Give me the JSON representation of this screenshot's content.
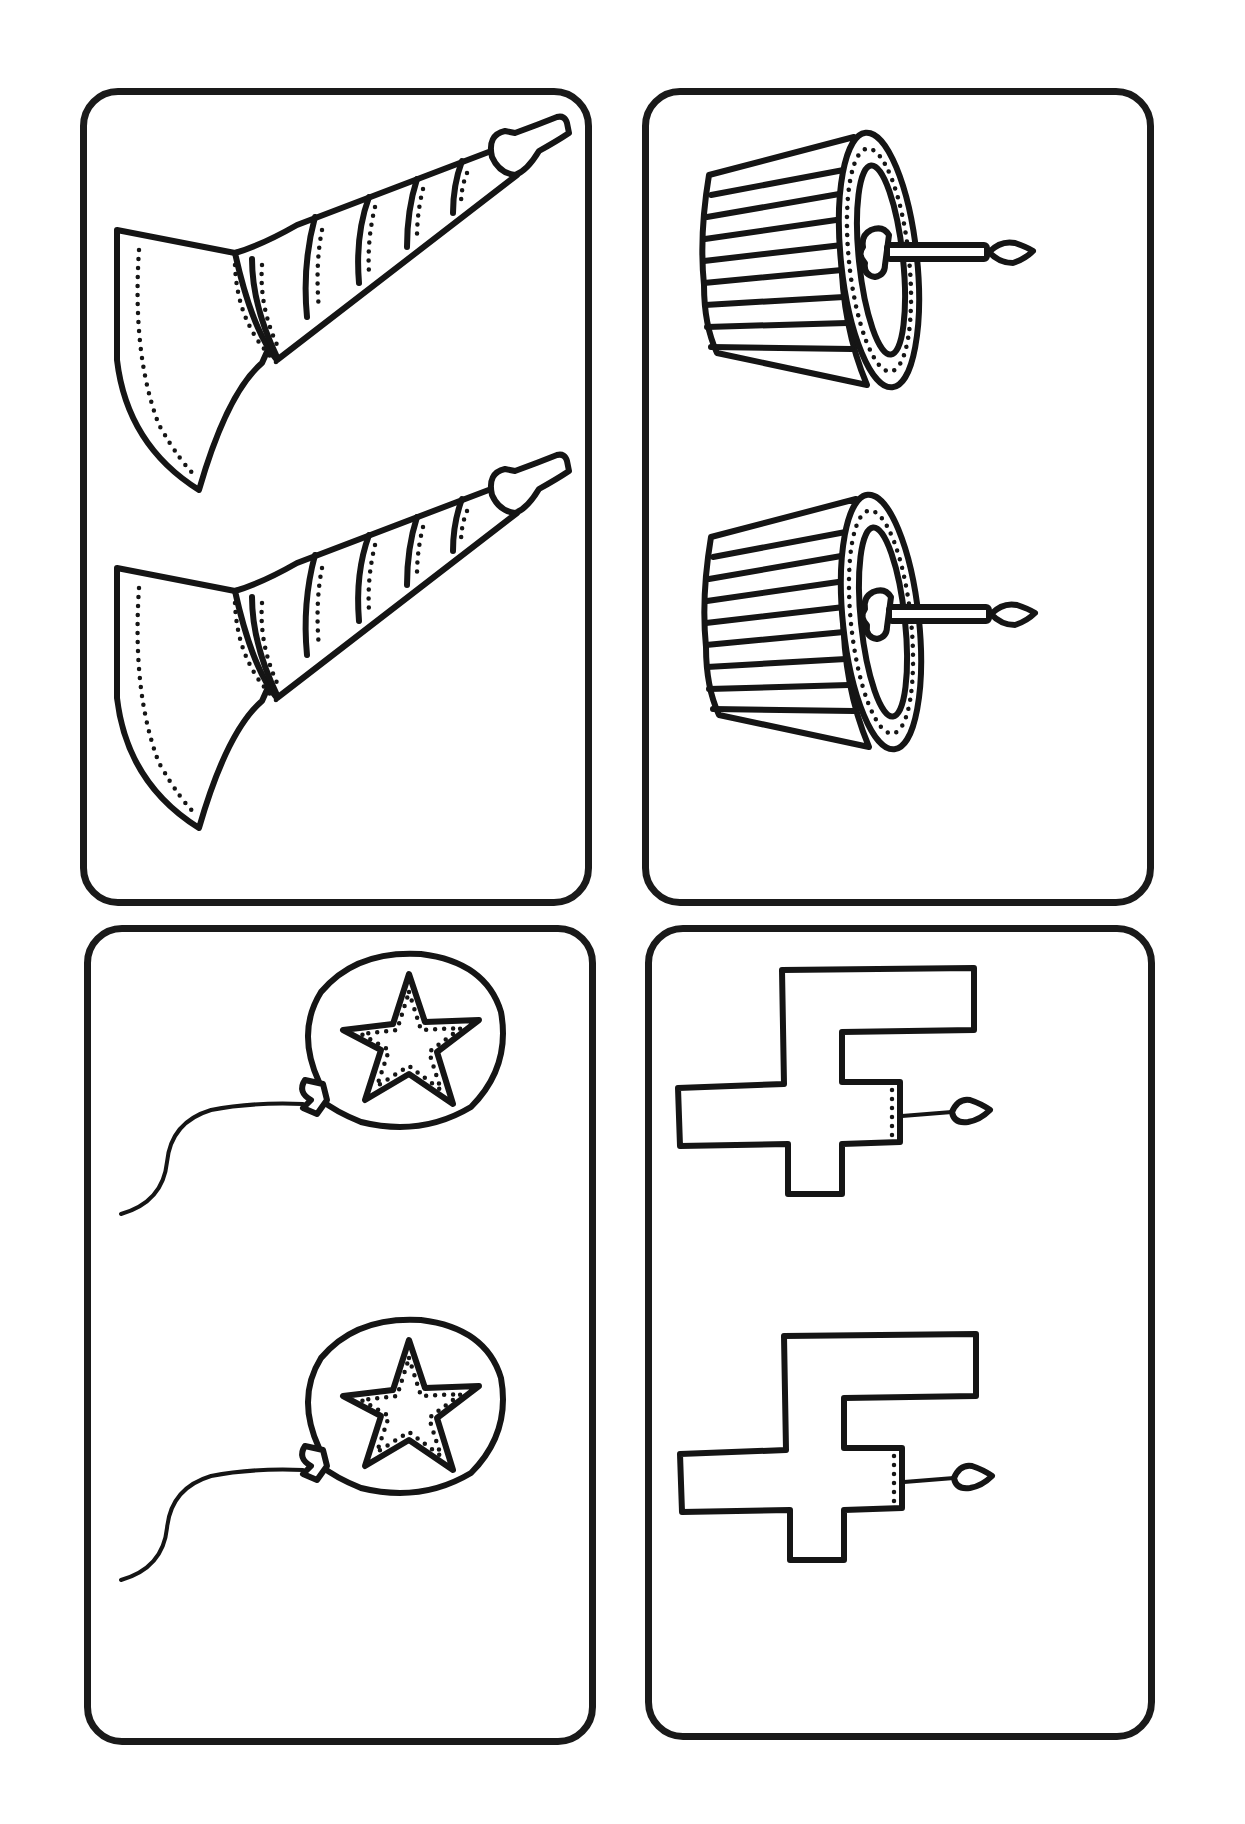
{
  "sheet": {
    "type": "matching-cards",
    "theme": "birthday party",
    "background_color": "#ffffff",
    "ink_color": "#151515",
    "layout": {
      "columns": 2,
      "rows": 2,
      "items_per_card": 2
    }
  },
  "cards": [
    {
      "id": "card-1",
      "position": "top-left",
      "item": "party horn",
      "icon": "party-horn-icon",
      "count": 2
    },
    {
      "id": "card-2",
      "position": "top-right",
      "item": "cupcake with candle",
      "icon": "cupcake-icon",
      "count": 2
    },
    {
      "id": "card-3",
      "position": "bottom-left",
      "item": "star balloon",
      "icon": "star-balloon-icon",
      "count": 2
    },
    {
      "id": "card-4",
      "position": "bottom-right",
      "item": "number 4 candle",
      "icon": "number-four-candle-icon",
      "count": 2
    }
  ]
}
